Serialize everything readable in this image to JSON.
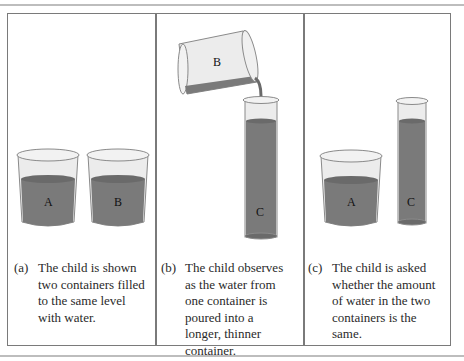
{
  "figure": {
    "colors": {
      "water": "#7a7a7a",
      "water_dark": "#5f5f5f",
      "glass": "#e6e6e6",
      "glass_edge": "#8a8a8a",
      "frame": "#7a7a7a",
      "rule": "#bdbdbd"
    },
    "panels": [
      {
        "tag": "(a)",
        "caption_lines": [
          "The child is shown",
          "two containers filled",
          "to the same level",
          "with water."
        ],
        "containers": [
          "A",
          "B"
        ]
      },
      {
        "tag": "(b)",
        "caption_lines": [
          "The child observes",
          "as the water from",
          "one container is",
          "poured into a",
          "longer, thinner",
          "container."
        ],
        "containers": [
          "B",
          "C"
        ]
      },
      {
        "tag": "(c)",
        "caption_lines": [
          "The child is asked",
          "whether the amount",
          "of water in the two",
          "containers is the",
          "same."
        ],
        "containers": [
          "A",
          "C"
        ]
      }
    ]
  }
}
